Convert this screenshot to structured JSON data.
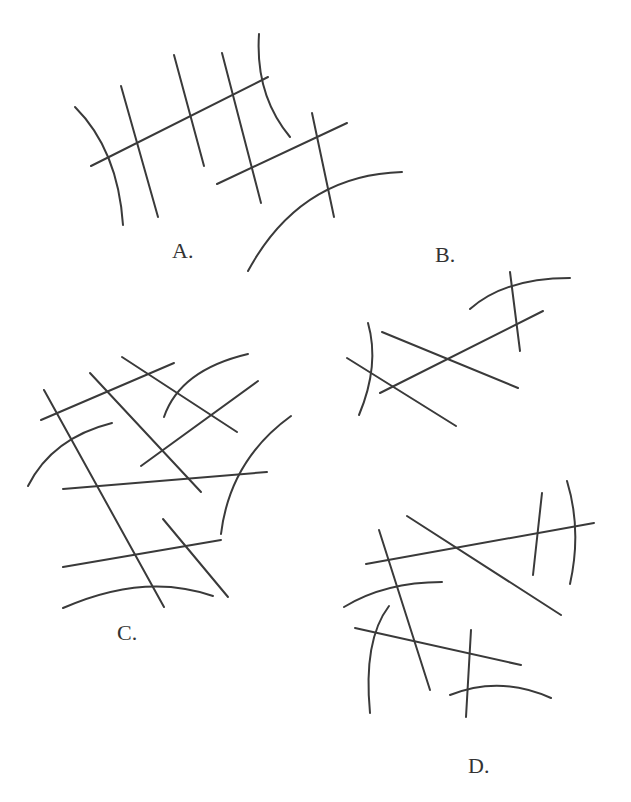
{
  "figure": {
    "stroke_color": "#3a3a3a",
    "background": "#ffffff",
    "panels": [
      {
        "label": "A.",
        "label_pos": [
          172,
          258
        ],
        "shapes": [
          {
            "type": "arc",
            "d": "M75,107 Q118,150 123,225"
          },
          {
            "type": "line",
            "d": "M121,86 L158,217"
          },
          {
            "type": "line",
            "d": "M174,55 L204,166"
          },
          {
            "type": "line",
            "d": "M222,53 L261,203"
          },
          {
            "type": "line",
            "d": "M91,166 L268,77"
          },
          {
            "type": "arc",
            "d": "M259,34 Q255,95 290,137"
          },
          {
            "type": "line",
            "d": "M312,113 L334,217"
          },
          {
            "type": "line",
            "d": "M217,184 L347,123"
          },
          {
            "type": "arc",
            "d": "M248,271 Q300,175 402,172"
          }
        ]
      },
      {
        "label": "B.",
        "label_pos": [
          435,
          262
        ],
        "shapes": [
          {
            "type": "arc",
            "d": "M470,309 Q505,278 570,278"
          },
          {
            "type": "line",
            "d": "M510,272 L520,351"
          },
          {
            "type": "line",
            "d": "M380,393 L543,311"
          },
          {
            "type": "line",
            "d": "M382,332 L518,388"
          },
          {
            "type": "arc",
            "d": "M368,323 Q380,365 359,415"
          },
          {
            "type": "line",
            "d": "M347,358 L456,426"
          }
        ]
      },
      {
        "label": "C.",
        "label_pos": [
          117,
          640
        ],
        "shapes": [
          {
            "type": "line",
            "d": "M44,390 L164,607"
          },
          {
            "type": "line",
            "d": "M41,420 L174,363"
          },
          {
            "type": "line",
            "d": "M122,357 L237,432"
          },
          {
            "type": "arc",
            "d": "M164,417 Q180,370 248,354"
          },
          {
            "type": "line",
            "d": "M90,373 L201,492"
          },
          {
            "type": "line",
            "d": "M141,466 L258,381"
          },
          {
            "type": "arc",
            "d": "M28,486 Q52,438 112,423"
          },
          {
            "type": "line",
            "d": "M63,489 L267,472"
          },
          {
            "type": "arc",
            "d": "M291,416 Q230,460 221,534"
          },
          {
            "type": "line",
            "d": "M163,519 L228,597"
          },
          {
            "type": "line",
            "d": "M63,567 L221,540"
          },
          {
            "type": "arc",
            "d": "M63,608 Q145,572 213,596"
          }
        ]
      },
      {
        "label": "D.",
        "label_pos": [
          468,
          773
        ],
        "shapes": [
          {
            "type": "line",
            "d": "M407,516 L561,615"
          },
          {
            "type": "line",
            "d": "M366,564 L594,523"
          },
          {
            "type": "line",
            "d": "M542,493 L533,575"
          },
          {
            "type": "arc",
            "d": "M567,481 Q582,530 570,584"
          },
          {
            "type": "line",
            "d": "M379,530 L430,690"
          },
          {
            "type": "arc",
            "d": "M344,607 Q385,582 442,582"
          },
          {
            "type": "arc",
            "d": "M389,606 Q363,640 370,713"
          },
          {
            "type": "line",
            "d": "M355,628 L521,665"
          },
          {
            "type": "line",
            "d": "M471,630 L466,717"
          },
          {
            "type": "arc",
            "d": "M450,695 Q500,675 551,698"
          }
        ]
      }
    ]
  }
}
